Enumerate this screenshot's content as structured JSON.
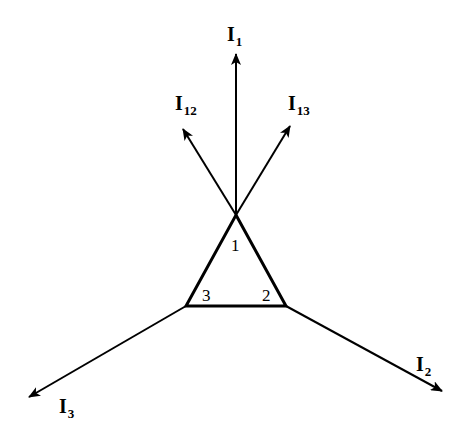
{
  "diagram": {
    "type": "current-vector-diagram",
    "colors": {
      "stroke": "#000000",
      "background": "#ffffff"
    },
    "triangle": {
      "nodes": [
        {
          "id": "1",
          "label": "1",
          "x": 236,
          "y": 215
        },
        {
          "id": "2",
          "label": "2",
          "x": 286,
          "y": 306
        },
        {
          "id": "3",
          "label": "3",
          "x": 186,
          "y": 306
        }
      ]
    },
    "arrows": [
      {
        "id": "I1",
        "label_main": "I",
        "label_sub": "1",
        "from": [
          236,
          215
        ],
        "to": [
          236,
          52
        ]
      },
      {
        "id": "I12",
        "label_main": "I",
        "label_sub": "12",
        "from": [
          236,
          215
        ],
        "to": [
          182,
          127
        ]
      },
      {
        "id": "I13",
        "label_main": "I",
        "label_sub": "13",
        "from": [
          236,
          215
        ],
        "to": [
          291,
          124
        ]
      },
      {
        "id": "I2",
        "label_main": "I",
        "label_sub": "2",
        "from": [
          286,
          306
        ],
        "to": [
          444,
          392
        ]
      },
      {
        "id": "I3",
        "label_main": "I",
        "label_sub": "3",
        "from": [
          186,
          306
        ],
        "to": [
          27,
          398
        ]
      }
    ]
  }
}
